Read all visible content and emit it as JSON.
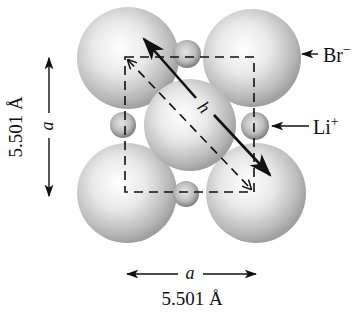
{
  "diagram": {
    "anion_label": "Br",
    "anion_charge": "−",
    "cation_label": "Li",
    "cation_charge": "+",
    "edge_symbol": "a",
    "diagonal_symbol": "h",
    "vertical_dimension": "5.501 Å",
    "horizontal_dimension": "5.501 Å",
    "colors": {
      "sphere_light": "#f4f4f4",
      "sphere_dark": "#9a9a9a",
      "line": "#111111",
      "background": "#ffffff"
    }
  }
}
